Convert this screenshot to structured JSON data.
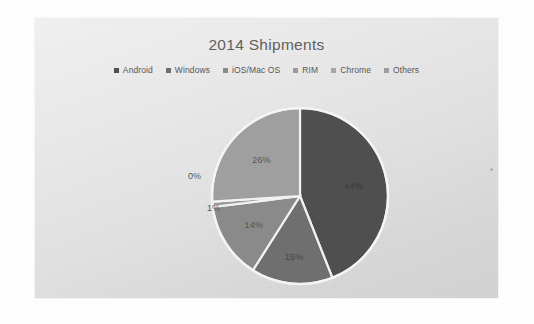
{
  "chart_data": {
    "type": "pie",
    "title": "2014 Shipments",
    "categories": [
      "Android",
      "Windows",
      "iOS/Mac OS",
      "RIM",
      "Chrome",
      "Others"
    ],
    "values": [
      44,
      15,
      14,
      1,
      0,
      26
    ],
    "data_labels": [
      "44%",
      "15%",
      "14%",
      "1%",
      "0%",
      "26%"
    ],
    "colors": [
      "#4f4f4f",
      "#6f6f6f",
      "#8a8a8a",
      "#9a9a9a",
      "#a6a6a6",
      "#9f9f9f"
    ],
    "legend_position": "top",
    "grid": false,
    "xlabel": "",
    "ylabel": "",
    "start_angle_deg": 0,
    "direction": "clockwise",
    "slice_border_color": "#f2f2f2"
  },
  "panel": {
    "background_top": "#f2f2f2",
    "background_bottom": "#d3d3d3"
  },
  "legend": {
    "items": [
      {
        "label": "Android",
        "color": "#4f4f4f"
      },
      {
        "label": "Windows",
        "color": "#6f6f6f"
      },
      {
        "label": "iOS/Mac OS",
        "color": "#8a8a8a"
      },
      {
        "label": "RIM",
        "color": "#9a9a9a"
      },
      {
        "label": "Chrome",
        "color": "#a6a6a6"
      },
      {
        "label": "Others",
        "color": "#9f9f9f"
      }
    ]
  },
  "labels": {
    "android": "44%",
    "windows": "15%",
    "ios": "14%",
    "rim": "1%",
    "chrome": "0%",
    "others": "26%"
  }
}
